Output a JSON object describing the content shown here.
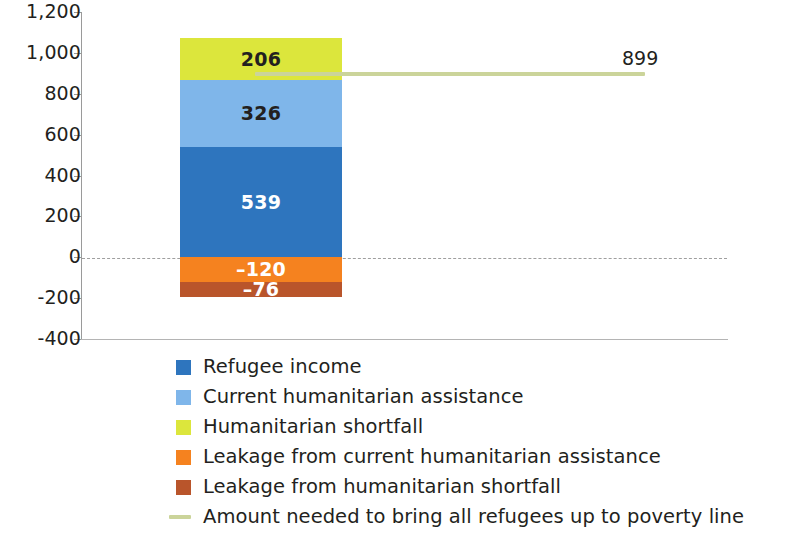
{
  "chart_data": {
    "type": "bar",
    "title": "",
    "subtitle": "",
    "xlabel": "",
    "ylabel": "",
    "stacked": true,
    "categories": [
      ""
    ],
    "ylim": [
      -400,
      1200
    ],
    "yticks": [
      1200,
      1000,
      800,
      600,
      400,
      200,
      0,
      -200,
      -400
    ],
    "ytick_labels": [
      "1,200",
      "1,000",
      "800",
      "600",
      "400",
      "200",
      "0",
      "-200",
      "-400"
    ],
    "grid": false,
    "zero_line": true,
    "legend_position": "bottom",
    "series": [
      {
        "name": "Refugee income",
        "values": [
          539
        ],
        "label": "539",
        "color": "#2E75BE",
        "label_color": "light"
      },
      {
        "name": "Current humanitarian assistance",
        "values": [
          326
        ],
        "label": "326",
        "color": "#7FB6EA",
        "label_color": "dark"
      },
      {
        "name": "Humanitarian shortfall",
        "values": [
          206
        ],
        "label": "206",
        "color": "#DCE63C",
        "label_color": "dark"
      },
      {
        "name": "Leakage from current humanitarian assistance",
        "values": [
          -120
        ],
        "label": "–120",
        "color": "#F5821F",
        "label_color": "light"
      },
      {
        "name": "Leakage from humanitarian shortfall",
        "values": [
          -76
        ],
        "label": "–76",
        "color": "#B9552B",
        "label_color": "light"
      }
    ],
    "reference_line": {
      "name": "Amount needed to bring all refugees up to poverty line",
      "value": 899,
      "label": "899",
      "color": "#CBD49A"
    },
    "legend": [
      {
        "label": "Refugee income",
        "color": "#2E75BE",
        "marker": "square"
      },
      {
        "label": "Current humanitarian assistance",
        "color": "#7FB6EA",
        "marker": "square"
      },
      {
        "label": "Humanitarian shortfall",
        "color": "#DCE63C",
        "marker": "square"
      },
      {
        "label": "Leakage from current humanitarian assistance",
        "color": "#F5821F",
        "marker": "square"
      },
      {
        "label": "Leakage from humanitarian shortfall",
        "color": "#B9552B",
        "marker": "square"
      },
      {
        "label": "Amount needed to bring all refugees up to poverty line",
        "color": "#CBD49A",
        "marker": "line"
      }
    ]
  }
}
